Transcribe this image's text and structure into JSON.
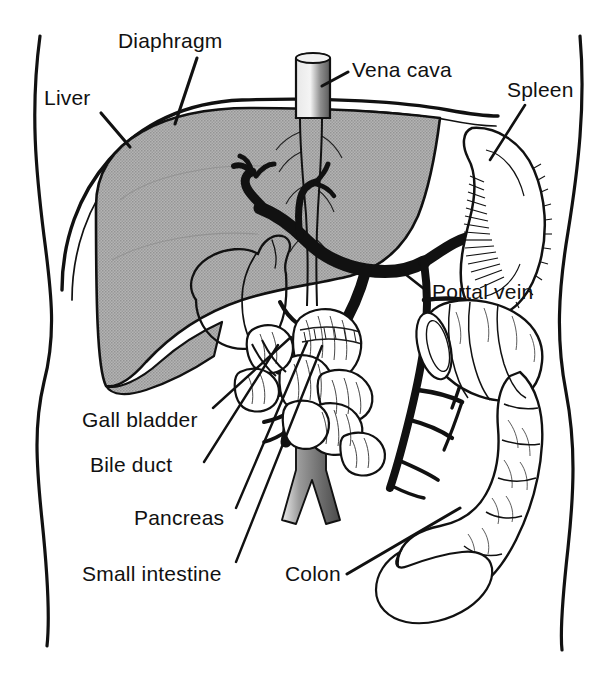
{
  "figure": {
    "view": "anterior view of human torso",
    "colors": {
      "background": "#ffffff",
      "ink": "#111111",
      "liver_fill": "#a9a9a9",
      "vessel_black": "#111111",
      "aorta_gray": "#6f6f6f",
      "vena_cava_gray": "#cfcfcf"
    }
  },
  "labels": [
    {
      "id": "diaphragm",
      "text": "Diaphragm",
      "x": 118,
      "y": 48
    },
    {
      "id": "liver",
      "text": "Liver",
      "x": 44,
      "y": 105
    },
    {
      "id": "vena-cava",
      "text": "Vena cava",
      "x": 352,
      "y": 77
    },
    {
      "id": "spleen",
      "text": "Spleen",
      "x": 507,
      "y": 97
    },
    {
      "id": "portal-vein",
      "text": "Portal vein",
      "x": 432,
      "y": 299
    },
    {
      "id": "gall-bladder",
      "text": "Gall bladder",
      "x": 82,
      "y": 427
    },
    {
      "id": "bile-duct",
      "text": "Bile duct",
      "x": 90,
      "y": 472
    },
    {
      "id": "pancreas",
      "text": "Pancreas",
      "x": 134,
      "y": 525
    },
    {
      "id": "small-intestine",
      "text": "Small intestine",
      "x": 82,
      "y": 581
    },
    {
      "id": "colon",
      "text": "Colon",
      "x": 285,
      "y": 581
    }
  ],
  "leader_lines": [
    {
      "id": "diaphragm-leader",
      "x1": 197,
      "y1": 58,
      "x2": 175,
      "y2": 124
    },
    {
      "id": "liver-leader",
      "x1": 101,
      "y1": 113,
      "x2": 130,
      "y2": 147
    },
    {
      "id": "vena-cava-leader",
      "x1": 348,
      "y1": 72,
      "x2": 322,
      "y2": 86
    },
    {
      "id": "spleen-leader",
      "x1": 525,
      "y1": 105,
      "x2": 490,
      "y2": 160
    },
    {
      "id": "portal-vein-leader",
      "x1": 428,
      "y1": 292,
      "x2": 400,
      "y2": 270
    },
    {
      "id": "gall-bladder-leader",
      "x1": 213,
      "y1": 408,
      "x2": 291,
      "y2": 337
    },
    {
      "id": "bile-duct-leader",
      "x1": 204,
      "y1": 462,
      "x2": 278,
      "y2": 345
    },
    {
      "id": "pancreas-leader",
      "x1": 236,
      "y1": 508,
      "x2": 307,
      "y2": 342
    },
    {
      "id": "small-intestine-leader",
      "x1": 236,
      "y1": 562,
      "x2": 322,
      "y2": 346
    },
    {
      "id": "colon-leader",
      "x1": 347,
      "y1": 574,
      "x2": 460,
      "y2": 508
    }
  ],
  "organs": [
    {
      "id": "body-outline-left",
      "name": "left torso contour"
    },
    {
      "id": "body-outline-right",
      "name": "right torso contour"
    },
    {
      "id": "diaphragm-arc",
      "name": "diaphragm dome double line"
    },
    {
      "id": "liver",
      "name": "liver, gray halftone lobe"
    },
    {
      "id": "gall-bladder",
      "name": "gall bladder, pear shape in liver"
    },
    {
      "id": "vena-cava",
      "name": "inferior vena cava, vertical tube"
    },
    {
      "id": "aorta",
      "name": "aorta with bifurcation"
    },
    {
      "id": "portal-vein",
      "name": "portal vein trunk and tributaries"
    },
    {
      "id": "splenic-vein",
      "name": "splenic vein to spleen hilum"
    },
    {
      "id": "superior-mesenteric-vein",
      "name": "superior mesenteric vein"
    },
    {
      "id": "spleen",
      "name": "spleen, hatched comma shape"
    },
    {
      "id": "small-intestine",
      "name": "small intestine loops"
    },
    {
      "id": "colon",
      "name": "colon, transverse cut end and descending"
    }
  ]
}
